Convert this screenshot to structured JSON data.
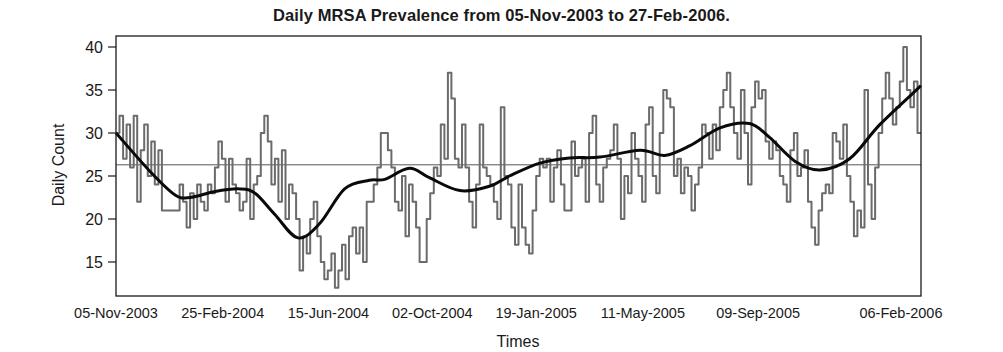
{
  "chart_data": {
    "type": "line",
    "title": "Daily MRSA Prevalence from 05-Nov-2003 to 27-Feb-2006.",
    "xlabel": "Times",
    "ylabel": "Daily Count",
    "x_range": [
      "05-Nov-2003",
      "27-Feb-2006"
    ],
    "ylim": [
      11,
      41.5
    ],
    "yticks": [
      15,
      20,
      25,
      30,
      35,
      40
    ],
    "xtick_labels": [
      "05-Nov-2003",
      "25-Feb-2004",
      "15-Jun-2004",
      "02-Oct-2004",
      "19-Jan-2005",
      "11-May-2005",
      "09-Sep-2005",
      "06-Feb-2006"
    ],
    "xtick_day_offsets": [
      0,
      112,
      223,
      332,
      441,
      553,
      674,
      824
    ],
    "total_days": 845,
    "grid": false,
    "legend": null,
    "reference_line": {
      "label": "mean",
      "value": 26.3,
      "color": "#555555"
    },
    "series": [
      {
        "name": "Daily MRSA count",
        "style": "step",
        "color": "#6b6b6b",
        "step_days": 4,
        "values": [
          30,
          32,
          27,
          31,
          26,
          32,
          22,
          28,
          31,
          25,
          29,
          24,
          28,
          21,
          21,
          21,
          21,
          21,
          24,
          22,
          19,
          23,
          20,
          24,
          22,
          21,
          24,
          23,
          26,
          29,
          27,
          22,
          27,
          24,
          23,
          21,
          22,
          27,
          20,
          24,
          25,
          30,
          32,
          29,
          24,
          27,
          22,
          28,
          20,
          24,
          23,
          20,
          14,
          18,
          16,
          20,
          22,
          18,
          15,
          13,
          14,
          16,
          12,
          14,
          17,
          13,
          18,
          19,
          16,
          19,
          15,
          22,
          22,
          24,
          26,
          30,
          30,
          28,
          26,
          22,
          21,
          25,
          18,
          24,
          22,
          19,
          15,
          15,
          20,
          23,
          26,
          25,
          31,
          27,
          37,
          34,
          27,
          26,
          31,
          26,
          22,
          19,
          24,
          31,
          26,
          25,
          24,
          22,
          20,
          33,
          25,
          24,
          19,
          17,
          24,
          19,
          17,
          16,
          21,
          25,
          27,
          26,
          27,
          22,
          26,
          28,
          24,
          21,
          21,
          29,
          25,
          26,
          27,
          22,
          30,
          32,
          24,
          22,
          26,
          27,
          28,
          31,
          27,
          20,
          25,
          23,
          30,
          27,
          25,
          22,
          31,
          33,
          25,
          23,
          30,
          35,
          34,
          33,
          25,
          27,
          23,
          26,
          25,
          21,
          24,
          26,
          31,
          30,
          27,
          31,
          28,
          33,
          35,
          37,
          33,
          30,
          27,
          35,
          30,
          24,
          33,
          36,
          34,
          35,
          29,
          27,
          29,
          28,
          25,
          24,
          22,
          28,
          30,
          25,
          26,
          28,
          22,
          19,
          17,
          21,
          23,
          24,
          23,
          30,
          29,
          27,
          31,
          25,
          22,
          18,
          21,
          19,
          35,
          24,
          20,
          26,
          30,
          34,
          37,
          34,
          31,
          33,
          36,
          40,
          35,
          33,
          36,
          30
        ]
      },
      {
        "name": "Smoothed trend",
        "style": "smooth",
        "color": "#0a0a0a",
        "points": [
          [
            0,
            30
          ],
          [
            36,
            25.5
          ],
          [
            62,
            22.8
          ],
          [
            78,
            22.5
          ],
          [
            104,
            23.2
          ],
          [
            130,
            23.5
          ],
          [
            146,
            23.0
          ],
          [
            167,
            20.5
          ],
          [
            191,
            17.8
          ],
          [
            214,
            19.5
          ],
          [
            240,
            23.5
          ],
          [
            266,
            24.5
          ],
          [
            282,
            24.6
          ],
          [
            308,
            25.9
          ],
          [
            329,
            24.8
          ],
          [
            361,
            23.3
          ],
          [
            392,
            23.8
          ],
          [
            413,
            25.0
          ],
          [
            445,
            26.5
          ],
          [
            476,
            27.1
          ],
          [
            508,
            27.2
          ],
          [
            550,
            28.0
          ],
          [
            576,
            27.4
          ],
          [
            602,
            28.5
          ],
          [
            634,
            30.6
          ],
          [
            665,
            31.1
          ],
          [
            686,
            29.5
          ],
          [
            713,
            26.7
          ],
          [
            739,
            25.7
          ],
          [
            770,
            27.0
          ],
          [
            802,
            31.0
          ],
          [
            845,
            35.5
          ]
        ]
      }
    ]
  }
}
